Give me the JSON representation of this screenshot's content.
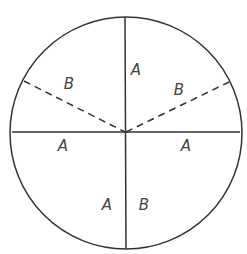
{
  "diagram": {
    "title": "",
    "stroke_color": "#333333",
    "label_color": "#444444",
    "circle": {
      "cx": 126,
      "cy": 133,
      "r": 116
    },
    "solid_lines": [
      {
        "name": "vertical-diameter",
        "x1": 125,
        "y1": 17,
        "x2": 126,
        "y2": 249
      },
      {
        "name": "horizontal-diameter",
        "x1": 12,
        "y1": 132,
        "x2": 240,
        "y2": 132
      }
    ],
    "dashed_lines": [
      {
        "name": "left-dashed-radius",
        "x1": 24,
        "y1": 81,
        "x2": 125,
        "y2": 132
      },
      {
        "name": "right-dashed-radius",
        "x1": 126,
        "y1": 132,
        "x2": 229,
        "y2": 82
      }
    ],
    "labels": [
      {
        "name": "label-top-right-a",
        "text": "A",
        "x": 136,
        "y": 70
      },
      {
        "name": "label-top-left-b",
        "text": "B",
        "x": 69,
        "y": 84
      },
      {
        "name": "label-top-right-b",
        "text": "B",
        "x": 179,
        "y": 90
      },
      {
        "name": "label-left-a",
        "text": "A",
        "x": 63,
        "y": 146
      },
      {
        "name": "label-right-a",
        "text": "A",
        "x": 186,
        "y": 146
      },
      {
        "name": "label-bottom-a",
        "text": "A",
        "x": 107,
        "y": 205
      },
      {
        "name": "label-bottom-b",
        "text": "B",
        "x": 144,
        "y": 205
      }
    ]
  }
}
